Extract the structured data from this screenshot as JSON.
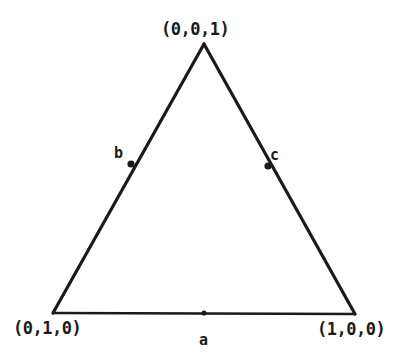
{
  "figure": {
    "background_color": "#ffffff",
    "stroke_color": "#1a1a1a",
    "vertices": {
      "top": {
        "label": "(0,0,1)",
        "x": 204,
        "y": 44
      },
      "bottom_left": {
        "label": "(0,1,0)",
        "x": 53,
        "y": 313
      },
      "bottom_right": {
        "label": "(1,0,0)",
        "x": 355,
        "y": 314
      }
    },
    "points": [
      {
        "label": "a",
        "edge": "bottom",
        "x": 204,
        "y": 313
      },
      {
        "label": "b",
        "edge": "left",
        "x": 131,
        "y": 164
      },
      {
        "label": "c",
        "edge": "right",
        "x": 268,
        "y": 166
      }
    ]
  }
}
